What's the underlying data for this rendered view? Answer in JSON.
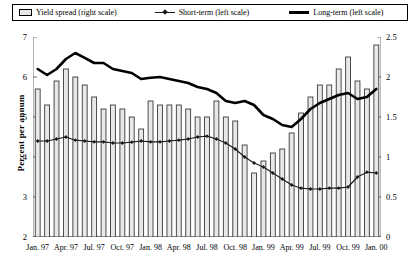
{
  "legend": {
    "items": [
      {
        "label": "Yield spread (right scale)",
        "icon": "bar-swatch-icon"
      },
      {
        "label": "Short-term (left scale)",
        "icon": "line-marker-swatch-icon"
      },
      {
        "label": "Long-term (left scale)",
        "icon": "thick-line-swatch-icon"
      }
    ]
  },
  "axes": {
    "ylabel_left": "Percent per annum",
    "left_ticks": [
      "7",
      "6",
      "5",
      "4",
      "3",
      "2"
    ],
    "right_ticks": [
      "2.5",
      "2",
      "1.5",
      "1",
      "0.5",
      "0"
    ],
    "x_tick_labels": [
      "Jan. 97",
      "Apr. 97",
      "Jul. 97",
      "Oct. 97",
      "Jan. 98",
      "Apr. 98",
      "Jul. 98",
      "Oct. 98",
      "Jan. 99",
      "Apr. 99",
      "Jul. 99",
      "Oct. 99",
      "Jan. 00"
    ]
  },
  "colors": {
    "bar_fill": "#e8e8e8",
    "bar_stroke": "#3a3a3a",
    "long_term_line": "#000000",
    "short_term_line": "#1a1a1a",
    "axis": "#6f6f6f"
  },
  "chart_data": {
    "type": "bar",
    "title": "",
    "xlabel": "",
    "ylabel": "Percent per annum",
    "grid": false,
    "legend_position": "top",
    "x": [
      "Jan. 97",
      "Feb. 97",
      "Mar. 97",
      "Apr. 97",
      "May 97",
      "Jun. 97",
      "Jul. 97",
      "Aug. 97",
      "Sep. 97",
      "Oct. 97",
      "Nov. 97",
      "Dec. 97",
      "Jan. 98",
      "Feb. 98",
      "Mar. 98",
      "Apr. 98",
      "May 98",
      "Jun. 98",
      "Jul. 98",
      "Aug. 98",
      "Sep. 98",
      "Oct. 98",
      "Nov. 98",
      "Dec. 98",
      "Jan. 99",
      "Feb. 99",
      "Mar. 99",
      "Apr. 99",
      "May 99",
      "Jun. 99",
      "Jul. 99",
      "Aug. 99",
      "Sep. 99",
      "Oct. 99",
      "Nov. 99",
      "Dec. 99",
      "Jan. 00"
    ],
    "series": [
      {
        "name": "Yield spread (right scale)",
        "type": "bar",
        "axis": "right",
        "ylim": [
          0,
          2.5
        ],
        "values": [
          1.85,
          1.65,
          1.95,
          2.1,
          2.0,
          1.9,
          1.75,
          1.6,
          1.65,
          1.6,
          1.5,
          1.35,
          1.7,
          1.65,
          1.65,
          1.65,
          1.6,
          1.5,
          1.5,
          1.7,
          1.5,
          1.45,
          1.15,
          0.8,
          0.95,
          1.05,
          1.1,
          1.3,
          1.55,
          1.75,
          1.9,
          1.9,
          2.1,
          2.25,
          1.95,
          1.85,
          2.4
        ]
      },
      {
        "name": "Short-term (left scale)",
        "type": "line",
        "axis": "left",
        "ylim": [
          2,
          7
        ],
        "values": [
          4.4,
          4.4,
          4.45,
          4.5,
          4.42,
          4.4,
          4.38,
          4.38,
          4.35,
          4.35,
          4.37,
          4.4,
          4.38,
          4.38,
          4.4,
          4.42,
          4.45,
          4.5,
          4.52,
          4.45,
          4.35,
          4.2,
          4.0,
          3.85,
          3.75,
          3.6,
          3.45,
          3.3,
          3.22,
          3.2,
          3.2,
          3.22,
          3.22,
          3.25,
          3.5,
          3.62,
          3.6
        ]
      },
      {
        "name": "Long-term (left scale)",
        "type": "line",
        "axis": "left",
        "ylim": [
          2,
          7
        ],
        "values": [
          6.2,
          6.05,
          6.2,
          6.45,
          6.6,
          6.48,
          6.35,
          6.35,
          6.2,
          6.15,
          6.1,
          5.95,
          5.98,
          6.0,
          5.95,
          5.9,
          5.85,
          5.75,
          5.7,
          5.6,
          5.4,
          5.35,
          5.4,
          5.3,
          5.05,
          4.95,
          4.8,
          4.75,
          4.95,
          5.2,
          5.35,
          5.45,
          5.55,
          5.6,
          5.45,
          5.5,
          5.7
        ]
      }
    ]
  }
}
